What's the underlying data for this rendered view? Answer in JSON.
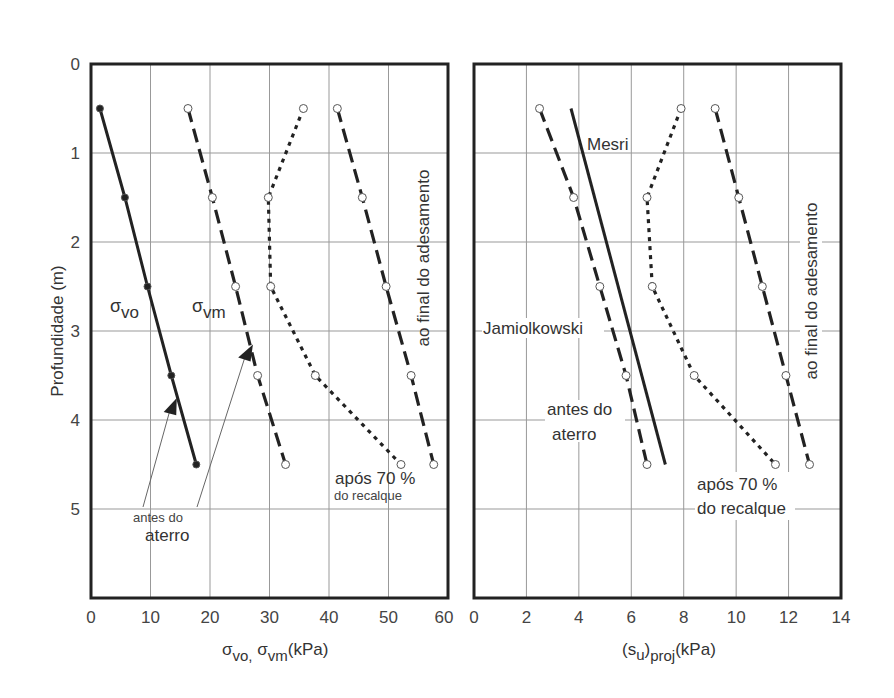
{
  "chart_data": [
    {
      "type": "line",
      "title": "",
      "xlabel": "σvo, σvm(kPa)",
      "xlabel_main": "σ",
      "ylabel": "Profundidade (m)",
      "xlim": [
        0,
        60
      ],
      "ylim": [
        6,
        0
      ],
      "x_ticks": [
        "0",
        "10",
        "20",
        "30",
        "40",
        "50",
        "60"
      ],
      "y_ticks": [
        "0",
        "1",
        "2",
        "3",
        "4",
        "5"
      ],
      "grid": true,
      "depths": [
        0.5,
        1.5,
        2.5,
        3.5,
        4.5
      ],
      "series": [
        {
          "name": "σvo",
          "style": "solid",
          "marker": "filled",
          "values": [
            1.5,
            5.7,
            9.5,
            13.5,
            17.7
          ]
        },
        {
          "name": "σvm (antes do aterro)",
          "style": "dashed",
          "marker": "open",
          "values": [
            16.3,
            20.4,
            24.3,
            28.0,
            32.7
          ]
        },
        {
          "name": "σvm após 70 % do recalque",
          "style": "dotted",
          "marker": "open",
          "values": [
            35.7,
            29.8,
            30.2,
            37.7,
            52.1
          ]
        },
        {
          "name": "σvm ao final do adesamento",
          "style": "dashed",
          "marker": "open",
          "values": [
            41.4,
            45.6,
            49.6,
            53.8,
            57.6
          ]
        }
      ],
      "annotations": {
        "svo_label": "σ",
        "svo_sub": "vo",
        "svm_label": "σ",
        "svm_sub": "vm",
        "antes_line1": "antes do",
        "antes_line2": "aterro",
        "apos_line1": "após 70 %",
        "apos_line2": "do recalque",
        "final": "ao final do adesamento"
      }
    },
    {
      "type": "line",
      "title": "",
      "xlabel": "(su)proj(kPa)",
      "ylabel": "Profundidade (m)",
      "xlim": [
        0,
        14
      ],
      "ylim": [
        6,
        0
      ],
      "x_ticks": [
        "0",
        "2",
        "4",
        "6",
        "8",
        "10",
        "12",
        "14"
      ],
      "grid": true,
      "depths": [
        0.5,
        1.5,
        2.5,
        3.5,
        4.5
      ],
      "series": [
        {
          "name": "Jamiolkowski (antes do aterro)",
          "style": "dashed",
          "marker": "open",
          "values": [
            2.5,
            3.8,
            4.8,
            5.8,
            6.6
          ]
        },
        {
          "name": "Mesri",
          "style": "solid",
          "marker": "none",
          "points": [
            [
              3.7,
              0.5
            ],
            [
              7.3,
              4.5
            ]
          ]
        },
        {
          "name": "após 70 % do recalque",
          "style": "dotted",
          "marker": "open",
          "values": [
            7.9,
            6.6,
            6.8,
            8.4,
            11.5
          ]
        },
        {
          "name": "ao final do adesamento",
          "style": "dashed",
          "marker": "open",
          "values": [
            9.2,
            10.1,
            11.0,
            11.9,
            12.8
          ]
        }
      ],
      "annotations": {
        "mesri": "Mesri",
        "jamiolkowski": "Jamiolkowski",
        "antes_line1": "antes do",
        "antes_line2": "aterro",
        "apos_line1": "após 70 %",
        "apos_line2": "do recalque",
        "final": "ao final do adesamento"
      }
    }
  ],
  "labels": {
    "y_axis_title": "Profundidade (m)",
    "left_x_title_pre": "σ",
    "left_x_sub1": "vo,",
    "left_x_mid": " σ",
    "left_x_sub2": "vm",
    "left_x_unit": "(kPa)",
    "right_x_pre": "(s",
    "right_x_sub1": "u",
    "right_x_mid": ")",
    "right_x_sub2": "proj",
    "right_x_unit": "(kPa)"
  }
}
